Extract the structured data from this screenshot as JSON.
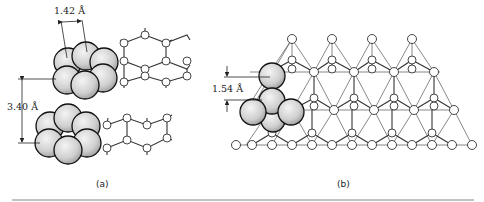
{
  "figure": {
    "panel_a": {
      "caption": "(a)",
      "bond_length_label": "1.42 Å",
      "interlayer_spacing_label": "3.40 Å",
      "description": "Graphite: two stacked hexagonal carbon sheets with space-filling atom clusters"
    },
    "panel_b": {
      "caption": "(b)",
      "bond_length_label": "1.54 Å",
      "description": "Diamond: tetrahedral carbon network with space-filling atom cluster"
    },
    "colors": {
      "line": "#333333",
      "sphere_light": "#eeeeee",
      "sphere_dark": "#9a9a9a",
      "separator": "#888888"
    }
  }
}
